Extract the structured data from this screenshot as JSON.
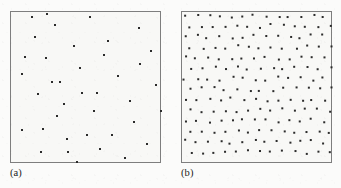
{
  "figure": {
    "width": 341,
    "height": 188,
    "background_color": "#fbfbfa",
    "panel_background_color": "#f8f8f6",
    "panel_border_color": "#7e7e7e",
    "point_color": "#2b2b2b"
  },
  "panels": [
    {
      "id": "panel-a",
      "label": "(a)",
      "caption_position": "below-left",
      "box": {
        "x": 10,
        "y": 11,
        "width": 151,
        "height": 152
      },
      "label_position": {
        "x": 10,
        "y": 168
      }
    },
    {
      "id": "panel-b",
      "label": "(b)",
      "caption_position": "below-left",
      "box": {
        "x": 181,
        "y": 11,
        "width": 151,
        "height": 152
      },
      "label_position": {
        "x": 181,
        "y": 168
      }
    }
  ],
  "chart_data": [
    {
      "type": "scatter",
      "id": "panel-a",
      "title": "(a)",
      "xlabel": "",
      "ylabel": "",
      "xlim": [
        0,
        151
      ],
      "ylim": [
        0,
        152
      ],
      "grid": false,
      "legend": "none",
      "marker": "square",
      "marker_size_px": 2,
      "n_points": 35,
      "annotation": "Completely spatially random (Poisson) point pattern",
      "points": [
        [
          11,
          62
        ],
        [
          11,
          118
        ],
        [
          14,
          45
        ],
        [
          21,
          5
        ],
        [
          24,
          25
        ],
        [
          27,
          82
        ],
        [
          30,
          140
        ],
        [
          32,
          117
        ],
        [
          35,
          46
        ],
        [
          36,
          2
        ],
        [
          41,
          70
        ],
        [
          44,
          13
        ],
        [
          46,
          104
        ],
        [
          49,
          70
        ],
        [
          53,
          92
        ],
        [
          56,
          127
        ],
        [
          57,
          140
        ],
        [
          63,
          34
        ],
        [
          66,
          150
        ],
        [
          69,
          56
        ],
        [
          71,
          81
        ],
        [
          76,
          123
        ],
        [
          79,
          5
        ],
        [
          83,
          99
        ],
        [
          86,
          81
        ],
        [
          89,
          137
        ],
        [
          93,
          43
        ],
        [
          97,
          29
        ],
        [
          101,
          123
        ],
        [
          107,
          64
        ],
        [
          114,
          146
        ],
        [
          119,
          89
        ],
        [
          123,
          110
        ],
        [
          128,
          16
        ],
        [
          129,
          52
        ],
        [
          136,
          132
        ],
        [
          140,
          39
        ],
        [
          145,
          73
        ],
        [
          150,
          99
        ]
      ]
    },
    {
      "type": "scatter",
      "id": "panel-b",
      "title": "(b)",
      "xlabel": "",
      "ylabel": "",
      "xlim": [
        0,
        151
      ],
      "ylim": [
        0,
        152
      ],
      "grid": false,
      "legend": "none",
      "marker": "square",
      "marker_size_px": 2,
      "n_points": 182,
      "annotation": "Regular / inhibited (jittered lattice) point pattern",
      "lattice": {
        "spacing_x": 11.6,
        "spacing_y": 10.5,
        "row_offset": 5.8,
        "jitter": 2.2
      }
    }
  ]
}
